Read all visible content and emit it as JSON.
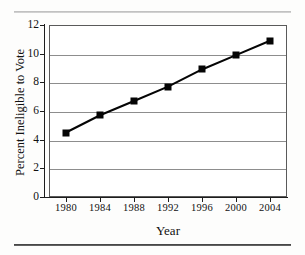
{
  "figure": {
    "rule_top": "horizontal-rule",
    "rule_bottom": "horizontal-rule"
  },
  "chart_data": {
    "type": "line",
    "title": "",
    "xlabel": "Year",
    "ylabel": "Percent Ineligible to Vote",
    "x": [
      1980,
      1984,
      1988,
      1992,
      1996,
      2000,
      2004
    ],
    "categories": [
      "1980",
      "1984",
      "1988",
      "1992",
      "1996",
      "2000",
      "2004"
    ],
    "values": [
      4.5,
      5.7,
      6.7,
      7.7,
      8.9,
      9.9,
      10.9
    ],
    "series": [
      {
        "name": "Percent Ineligible to Vote",
        "values": [
          4.5,
          5.7,
          6.7,
          7.7,
          8.9,
          9.9,
          10.9
        ]
      }
    ],
    "xlim": [
      1978,
      2006
    ],
    "ylim": [
      0,
      12
    ],
    "yticks": [
      0,
      2,
      4,
      6,
      8,
      10,
      12
    ],
    "ytick_labels": [
      "0",
      "2",
      "4",
      "6",
      "8",
      "10",
      "12"
    ],
    "xticks": [
      1980,
      1984,
      1988,
      1992,
      1996,
      2000,
      2004
    ],
    "xtick_labels": [
      "1980",
      "1984",
      "1988",
      "1992",
      "1996",
      "2000",
      "2004"
    ],
    "grid": "horizontal",
    "legend": "none",
    "marker": "square",
    "line_color": "#050505",
    "marker_color": "#050505",
    "grid_color": "#8d8d8d",
    "frame_color": "#5a5a5a",
    "background": "#ffffff"
  }
}
